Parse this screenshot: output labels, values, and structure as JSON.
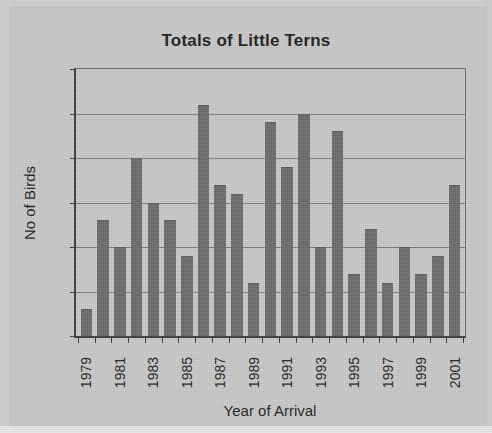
{
  "chart_data": {
    "type": "bar",
    "title": "Totals of Little Terns",
    "xlabel": "Year of Arrival",
    "ylabel": "No of Birds",
    "ylim": [
      0,
      30
    ],
    "ytick_step": 5,
    "yticks": [
      "30",
      "25",
      "20",
      "15",
      "10",
      "5",
      "0"
    ],
    "grid": true,
    "legend": false,
    "categories": [
      "1979",
      "1980",
      "1981",
      "1982",
      "1983",
      "1984",
      "1985",
      "1986",
      "1987",
      "1988",
      "1989",
      "1990",
      "1991",
      "1992",
      "1993",
      "1994",
      "1995",
      "1996",
      "1997",
      "1998",
      "1999",
      "2000",
      "2001"
    ],
    "tick_labels_shown": [
      "1979",
      "",
      "1981",
      "",
      "1983",
      "",
      "1985",
      "",
      "1987",
      "",
      "1989",
      "",
      "1991",
      "",
      "1993",
      "",
      "1995",
      "",
      "1997",
      "",
      "1999",
      "",
      "2001"
    ],
    "values": [
      3,
      13,
      10,
      20,
      15,
      13,
      9,
      26,
      17,
      16,
      6,
      24,
      19,
      25,
      10,
      23,
      7,
      12,
      6,
      10,
      7,
      9,
      17
    ],
    "bar_color": "#6c6c6c",
    "plot_background": "#c9c9c9",
    "gridline_color": "#7d7d7d",
    "axis_color": "#3a3a3a",
    "text_color": "#1d1d1d"
  }
}
